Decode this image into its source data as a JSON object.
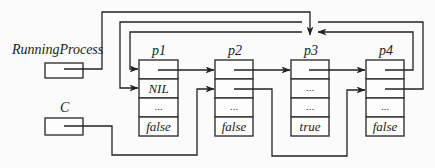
{
  "variables": [
    {
      "id": "running-process",
      "label": "RunningProcess",
      "points_to": "p3"
    },
    {
      "id": "c",
      "label": "C",
      "points_to": "p2"
    }
  ],
  "records": [
    {
      "id": "p1",
      "label": "p1",
      "fields": [
        "",
        "NIL",
        "...",
        "false"
      ]
    },
    {
      "id": "p2",
      "label": "p2",
      "fields": [
        "",
        "",
        "...",
        "false"
      ]
    },
    {
      "id": "p3",
      "label": "p3",
      "fields": [
        "",
        "...",
        "...",
        "true"
      ]
    },
    {
      "id": "p4",
      "label": "p4",
      "fields": [
        "",
        "",
        "...",
        "false"
      ]
    }
  ],
  "edges": [
    {
      "from": "RunningProcess",
      "to": "p3.top"
    },
    {
      "from": "C",
      "to": "p2.field2"
    },
    {
      "from": "p1.field1",
      "to": "p2.field1"
    },
    {
      "from": "p2.field1",
      "to": "p3.field1"
    },
    {
      "from": "p2.field2",
      "to": "p4.field2"
    },
    {
      "from": "p3.field1",
      "to": "p4.field1"
    },
    {
      "from": "p4.field1",
      "to": "p1.field1"
    },
    {
      "from": "p4.field2",
      "to": "p1.field2"
    }
  ],
  "colors": {
    "line": "#222222",
    "background": "#fbfbfb"
  }
}
